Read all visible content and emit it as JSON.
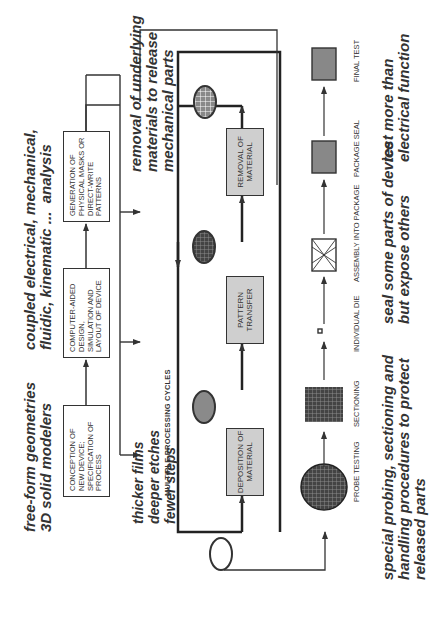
{
  "design_flow": {
    "boxes": [
      {
        "id": "conception",
        "text": "CONCEPTION OF NEW DEVICE; SPECIFICATION OF PROCESS"
      },
      {
        "id": "cad",
        "text": "COMPUTER-AIDED DESIGN, SIMULATION AND LAYOUT OF DEVICE"
      },
      {
        "id": "masks",
        "text": "GENERATION OF PHYSICAL MASKS OR DIRECT-WRITE PATTERNS"
      }
    ]
  },
  "cycle": {
    "label": "MULTIPLE PROCESSING CYCLES",
    "steps": [
      {
        "id": "deposition",
        "text": "DEPOSITION OF MATERIAL"
      },
      {
        "id": "pattern",
        "text": "PATTERN TRANSFER"
      },
      {
        "id": "removal",
        "text": "REMOVAL OF MATERIAL"
      }
    ]
  },
  "backend": {
    "steps": [
      {
        "id": "probe",
        "label": "PROBE TESTING"
      },
      {
        "id": "sectioning",
        "label": "SECTIONING"
      },
      {
        "id": "die",
        "label": "INDIVIDUAL DIE"
      },
      {
        "id": "assembly",
        "label": "ASSEMBLY INTO PACKAGE"
      },
      {
        "id": "seal",
        "label": "PACKAGE SEAL"
      },
      {
        "id": "final",
        "label": "FINAL TEST"
      }
    ]
  },
  "annotations": {
    "freeform": "free-form geometries\n3D solid modelers",
    "coupled": "coupled electrical, mechanical,\nfluidic, kinematic ...  analysis",
    "removal": "removal of underlying\nmaterials to release\nmechanical parts",
    "thicker": "thicker films\ndeeper etches\nfewer steps",
    "probing": "special probing, sectioning and\nhandling procedures to protect\nreleased parts",
    "seal": "seal some parts of device\nbut expose others",
    "test": "test more than\nelectrical function"
  },
  "colors": {
    "line": "#333333",
    "gray_box": "#cfcfcf",
    "wafer_gray": "#8a8a8a"
  }
}
